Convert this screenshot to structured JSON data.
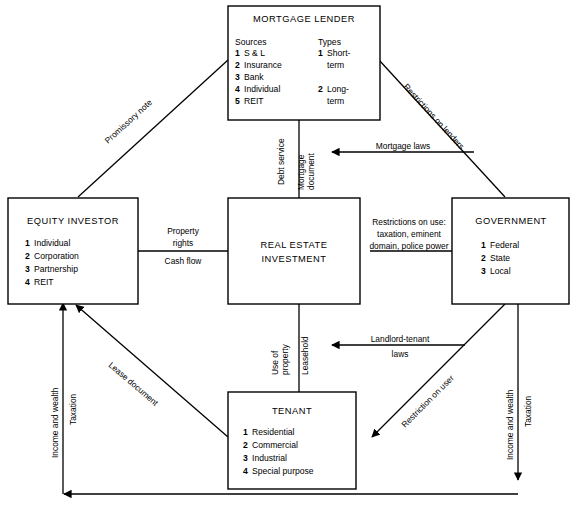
{
  "diagram": {
    "background": "#ffffff",
    "line_color": "#000000"
  },
  "boxes": {
    "mortgage_lender": {
      "title": "MORTGAGE LENDER",
      "col1_head": "Sources",
      "col2_head": "Types",
      "sources": [
        {
          "num": "1",
          "label": "S & L"
        },
        {
          "num": "2",
          "label": "Insurance"
        },
        {
          "num": "3",
          "label": "Bank"
        },
        {
          "num": "4",
          "label": "Individual"
        },
        {
          "num": "5",
          "label": "REIT"
        }
      ],
      "types": [
        {
          "num": "1",
          "label": "Short-",
          "label2": "term"
        },
        {
          "num": "2",
          "label": "Long-",
          "label2": "term"
        }
      ]
    },
    "equity_investor": {
      "title": "EQUITY INVESTOR",
      "items": [
        {
          "num": "1",
          "label": "Individual"
        },
        {
          "num": "2",
          "label": "Corporation"
        },
        {
          "num": "3",
          "label": "Partnership"
        },
        {
          "num": "4",
          "label": "REIT"
        }
      ]
    },
    "real_estate_investment": {
      "title_line1": "REAL ESTATE",
      "title_line2": "INVESTMENT"
    },
    "government": {
      "title": "GOVERNMENT",
      "items": [
        {
          "num": "1",
          "label": "Federal"
        },
        {
          "num": "2",
          "label": "State"
        },
        {
          "num": "3",
          "label": "Local"
        }
      ]
    },
    "tenant": {
      "title": "TENANT",
      "items": [
        {
          "num": "1",
          "label": "Residential"
        },
        {
          "num": "2",
          "label": "Commercial"
        },
        {
          "num": "3",
          "label": "Industrial"
        },
        {
          "num": "4",
          "label": "Special purpose"
        }
      ]
    }
  },
  "edges": {
    "promissory_note": "Promissory note",
    "restrictions_on_lenders": "Restrictions on lenders",
    "mortgage_laws": "Mortgage laws",
    "debt_service": "Debt service",
    "mortgage_document_l1": "Mortgage",
    "mortgage_document_l2": "document",
    "property_rights_l1": "Property",
    "property_rights_l2": "rights",
    "cash_flow": "Cash flow",
    "restrictions_on_use_l1": "Restrictions on use:",
    "restrictions_on_use_l2": "taxation, eminent",
    "restrictions_on_use_l3": "domain, police power",
    "use_of_property_l1": "Use of",
    "use_of_property_l2": "property",
    "leasehold": "Leasehold",
    "landlord_tenant_l1": "Landlord-tenant",
    "landlord_tenant_l2": "laws",
    "restriction_on_user": "Restriction on user",
    "lease_document": "Lease document",
    "income_and_wealth_left": "Income and wealth",
    "taxation_left": "Taxation",
    "income_and_wealth_right": "Income and wealth",
    "taxation_right": "Taxation"
  }
}
